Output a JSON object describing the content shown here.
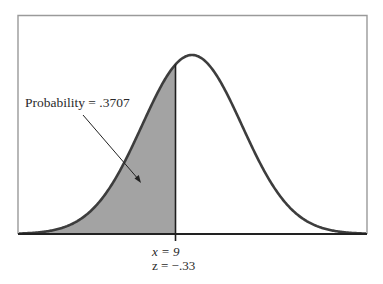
{
  "chart_data": {
    "type": "area",
    "title": "",
    "distribution": "normal",
    "annotation": {
      "text": "Probability = .3707",
      "probability": 0.3707
    },
    "cutoff": {
      "x_label": "x = 9",
      "z_label": "z = −.33",
      "x": 9,
      "z": -0.33
    },
    "shaded_region": "left of cutoff",
    "xlabel": "",
    "ylabel": "",
    "grid": false,
    "legend": null,
    "colors": {
      "curve": "#3d3d3d",
      "fill": "#a3a3a3",
      "frame": "#9a9a9a",
      "axis": "#2a2a2a"
    }
  },
  "labels": {
    "probability": "Probability = .3707",
    "x_value": "x = 9",
    "z_value": "z = −.33"
  }
}
